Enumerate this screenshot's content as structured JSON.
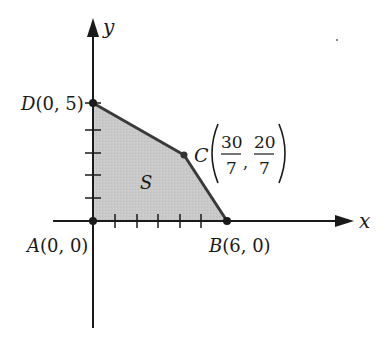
{
  "diagram": {
    "type": "feasible-region",
    "axes": {
      "x_label": "x",
      "y_label": "y",
      "x_ticks": [
        1,
        2,
        3,
        4,
        5,
        6
      ],
      "y_ticks": [
        1,
        2,
        3,
        4,
        5
      ]
    },
    "region": {
      "label": "S",
      "fill_color": "#c8c8c8",
      "edge_color": "#3a3a3a"
    },
    "vertices": [
      {
        "name": "A",
        "coord_text": "(0, 0)",
        "x": 0,
        "y": 0
      },
      {
        "name": "B",
        "coord_text": "(6, 0)",
        "x": 6,
        "y": 0
      },
      {
        "name": "C",
        "x_num": "30",
        "x_den": "7",
        "y_num": "20",
        "y_den": "7",
        "x": 4.2857,
        "y": 2.8571
      },
      {
        "name": "D",
        "coord_text": "(0, 5)",
        "x": 0,
        "y": 5
      }
    ]
  }
}
